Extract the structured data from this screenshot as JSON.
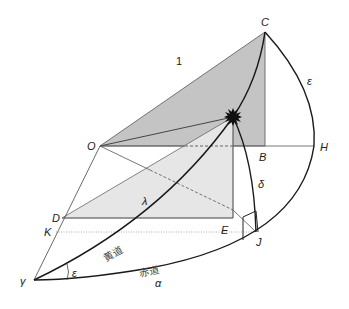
{
  "diagram": {
    "colors": {
      "dark_fill": "#c4c4c4",
      "light_fill": "#e6e6e6",
      "line": "#333333",
      "curve": "#1a1a1a",
      "star": "#111111"
    },
    "points": {
      "O": "O",
      "C": "C",
      "B": "B",
      "H": "H",
      "D": "D",
      "K": "K",
      "E": "E",
      "J": "J",
      "gamma": "γ"
    },
    "labels": {
      "radius": "1",
      "epsilon_arc": "ε",
      "epsilon_angle": "ε",
      "lambda": "λ",
      "delta": "δ",
      "alpha": "α",
      "ecliptic": "黄道",
      "equator": "赤道"
    },
    "icons": {
      "star": "star-icon"
    }
  }
}
